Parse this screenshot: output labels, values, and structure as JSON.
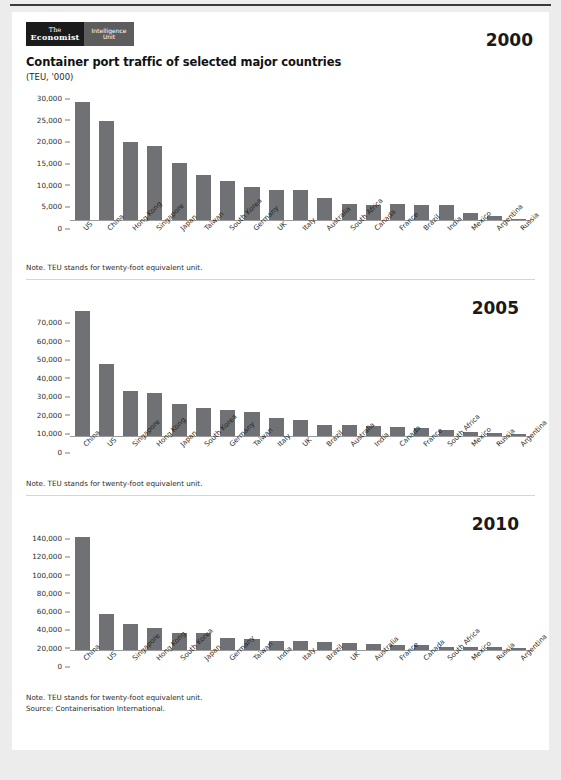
{
  "branding": {
    "logo_line1": "The",
    "logo_line2": "Economist",
    "logo_sub_line1": "Intelligence",
    "logo_sub_line2": "Unit"
  },
  "header": {
    "title": "Container port traffic of selected major countries",
    "units": "(TEU, '000)"
  },
  "notes": {
    "teu_note": "Note. TEU stands for twenty-foot equivalent unit.",
    "source": "Source: Containerisation International."
  },
  "colors": {
    "bar": "#6f7174",
    "axis": "#9a9a9a",
    "page_bg": "#ececed",
    "card_bg": "#ffffff",
    "logo_dark": "#1b1b1b",
    "logo_gray": "#5d5d5d"
  },
  "years": {
    "y2000": "2000",
    "y2005": "2005",
    "y2010": "2010"
  },
  "chart_data": [
    {
      "type": "bar",
      "title": "Container port traffic of selected major countries",
      "subtitle": "2000",
      "xlabel": "",
      "ylabel": "(TEU, '000)",
      "ylim": [
        0,
        30000
      ],
      "yticks": [
        0,
        5000,
        10000,
        15000,
        20000,
        25000,
        30000
      ],
      "ytick_labels": [
        "0",
        "5,000",
        "10,000",
        "15,000",
        "20,000",
        "25,000",
        "30,000"
      ],
      "grid": false,
      "legend": "none",
      "categories": [
        "US",
        "China",
        "Hong Kong",
        "Singapore",
        "Japan",
        "Taiwan",
        "South Korea",
        "Germany",
        "UK",
        "Italy",
        "Australia",
        "South Africa",
        "Canada",
        "France",
        "Brazil",
        "India",
        "Mexico",
        "Argentina",
        "Russia"
      ],
      "values": [
        27200,
        22800,
        18100,
        17100,
        13200,
        10500,
        9100,
        7700,
        7000,
        7000,
        5100,
        3700,
        3500,
        3600,
        3400,
        3500,
        1600,
        1000,
        300
      ]
    },
    {
      "type": "bar",
      "title": "Container port traffic of selected major countries",
      "subtitle": "2005",
      "xlabel": "",
      "ylabel": "(TEU, '000)",
      "ylim": [
        0,
        70000
      ],
      "yticks": [
        0,
        10000,
        20000,
        30000,
        40000,
        50000,
        60000,
        70000
      ],
      "ytick_labels": [
        "0",
        "10,000",
        "20,000",
        "30,000",
        "40,000",
        "50,000",
        "60,000",
        "70,000"
      ],
      "grid": false,
      "legend": "none",
      "categories": [
        "China",
        "US",
        "Singapore",
        "Hong Kong",
        "Japan",
        "South Korea",
        "Germany",
        "Taiwan",
        "Italy",
        "UK",
        "Brazil",
        "Australia",
        "India",
        "Canada",
        "France",
        "South Africa",
        "Mexico",
        "Russia",
        "Argentina"
      ],
      "values": [
        67500,
        38700,
        24100,
        22900,
        17500,
        15000,
        13800,
        13000,
        9800,
        8400,
        6000,
        5800,
        5500,
        4600,
        4500,
        3400,
        2300,
        1700,
        1200
      ]
    },
    {
      "type": "bar",
      "title": "Container port traffic of selected major countries",
      "subtitle": "2010",
      "xlabel": "",
      "ylabel": "(TEU, '000)",
      "ylim": [
        0,
        140000
      ],
      "yticks": [
        0,
        20000,
        40000,
        60000,
        80000,
        100000,
        120000,
        140000
      ],
      "ytick_labels": [
        "0",
        "20,000",
        "40,000",
        "60,000",
        "80,000",
        "100,000",
        "120,000",
        "140,000"
      ],
      "grid": false,
      "legend": "none",
      "categories": [
        "China",
        "US",
        "Singapore",
        "Hong Kong",
        "South Korea",
        "Japan",
        "Germany",
        "Taiwan",
        "India",
        "Italy",
        "Brazil",
        "UK",
        "Australia",
        "France",
        "Canada",
        "South Africa",
        "Mexico",
        "Russia",
        "Argentina"
      ],
      "values": [
        123500,
        39500,
        29000,
        23700,
        18500,
        18400,
        13400,
        11600,
        9900,
        9700,
        8700,
        7700,
        6300,
        5600,
        5000,
        3800,
        3400,
        3200,
        1700
      ]
    }
  ]
}
